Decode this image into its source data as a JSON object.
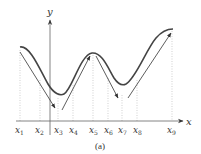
{
  "figure": {
    "caption": "(a)",
    "axes": {
      "x_label": "x",
      "y_label": "y"
    },
    "x_ticks": [
      {
        "name": "x",
        "sub": "1",
        "px": 20
      },
      {
        "name": "x",
        "sub": "2",
        "px": 40
      },
      {
        "name": "x",
        "sub": "3",
        "px": 58
      },
      {
        "name": "x",
        "sub": "4",
        "px": 73
      },
      {
        "name": "x",
        "sub": "5",
        "px": 93
      },
      {
        "name": "x",
        "sub": "6",
        "px": 108
      },
      {
        "name": "x",
        "sub": "7",
        "px": 122
      },
      {
        "name": "x",
        "sub": "8",
        "px": 137
      },
      {
        "name": "x",
        "sub": "9",
        "px": 172
      }
    ],
    "colors": {
      "curve": "#444444",
      "axis": "#666666",
      "guide": "#bbbbbb",
      "arrow": "#333333"
    }
  }
}
